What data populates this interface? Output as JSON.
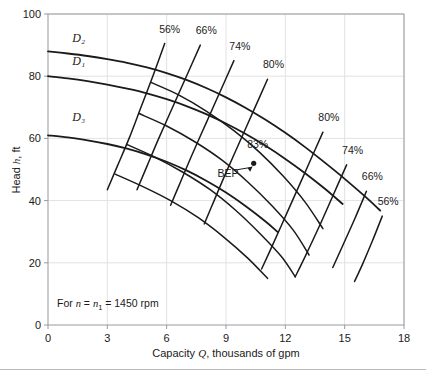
{
  "figure": {
    "note": "For n = n₁ = 1450 rpm",
    "note_prefix": "For ",
    "note_n1": "n",
    "note_eq1": " = ",
    "note_n2": "n",
    "note_sub": "1",
    "note_eq2": " = 1450 rpm",
    "bep_label": "BEP",
    "bep_value": "83%"
  },
  "axes": {
    "x": {
      "title": "Capacity Q, thousands of gpm",
      "title_prefix": "Capacity ",
      "title_symbol": "Q",
      "title_suffix": ", thousands of gpm",
      "ticks": [
        "0",
        "3",
        "6",
        "9",
        "12",
        "15",
        "18"
      ],
      "tick_values": [
        0,
        3,
        6,
        9,
        12,
        15,
        18
      ],
      "min": 0,
      "max": 18
    },
    "y": {
      "title": "Head h, ft",
      "title_prefix": "Head ",
      "title_symbol": "h",
      "title_suffix": ", ft",
      "ticks": [
        "0",
        "20",
        "40",
        "60",
        "80",
        "100"
      ],
      "tick_values": [
        0,
        20,
        40,
        60,
        80,
        100
      ],
      "min": 0,
      "max": 100
    }
  },
  "chart_data": {
    "type": "line",
    "title": "",
    "subtitle": "",
    "xlabel": "Capacity Q, thousands of gpm",
    "ylabel": "Head h, ft",
    "xlim": [
      0,
      18
    ],
    "ylim": [
      0,
      100
    ],
    "grid": true,
    "legend_position": "none",
    "annotations": [
      {
        "text": "For n = n₁ = 1450 rpm",
        "x": 1.3,
        "y": 10
      },
      {
        "text": "BEP",
        "x": 9.1,
        "y": 47.5
      },
      {
        "text": "83%",
        "x": 10.6,
        "y": 57
      }
    ],
    "bep_point": {
      "x": 10.4,
      "y": 52,
      "efficiency": 83
    },
    "series": [
      {
        "name": "D2",
        "label": "D₂",
        "label_x": 1.55,
        "label_y": 91,
        "points": [
          [
            0.0,
            88.0
          ],
          [
            1.0,
            87.3
          ],
          [
            2.0,
            86.5
          ],
          [
            3.0,
            85.5
          ],
          [
            4.0,
            84.3
          ],
          [
            5.0,
            82.8
          ],
          [
            6.0,
            81.0
          ],
          [
            7.0,
            78.8
          ],
          [
            8.0,
            76.2
          ],
          [
            9.0,
            73.2
          ],
          [
            10.0,
            69.8
          ],
          [
            11.0,
            66.0
          ],
          [
            12.0,
            61.8
          ],
          [
            13.0,
            57.2
          ],
          [
            14.0,
            52.2
          ],
          [
            15.0,
            47.0
          ],
          [
            16.0,
            41.5
          ],
          [
            16.8,
            36.8
          ]
        ]
      },
      {
        "name": "D1",
        "label": "D₁",
        "label_x": 1.55,
        "label_y": 83.5,
        "points": [
          [
            0.0,
            80.0
          ],
          [
            1.0,
            79.3
          ],
          [
            2.0,
            78.4
          ],
          [
            3.0,
            77.3
          ],
          [
            4.0,
            76.0
          ],
          [
            5.0,
            74.5
          ],
          [
            6.0,
            72.6
          ],
          [
            7.0,
            70.4
          ],
          [
            8.0,
            67.8
          ],
          [
            9.0,
            64.8
          ],
          [
            10.0,
            61.4
          ],
          [
            11.0,
            57.6
          ],
          [
            12.0,
            53.4
          ],
          [
            13.0,
            48.8
          ],
          [
            14.0,
            43.8
          ],
          [
            14.9,
            38.9
          ]
        ]
      },
      {
        "name": "D3",
        "label": "D₃",
        "label_x": 1.55,
        "label_y": 65.5,
        "points": [
          [
            0.0,
            61.0
          ],
          [
            1.0,
            60.3
          ],
          [
            2.0,
            59.4
          ],
          [
            3.0,
            58.2
          ],
          [
            4.0,
            56.7
          ],
          [
            5.0,
            54.8
          ],
          [
            6.0,
            52.5
          ],
          [
            7.0,
            49.7
          ],
          [
            8.0,
            46.4
          ],
          [
            9.0,
            42.6
          ],
          [
            10.0,
            38.2
          ],
          [
            11.0,
            33.3
          ],
          [
            11.6,
            30.0
          ]
        ]
      }
    ],
    "efficiency_curves": [
      {
        "label": "56%",
        "value": 56,
        "side": "left",
        "label_x": 6.15,
        "label_y": 94,
        "points": [
          [
            5.9,
            90.5
          ],
          [
            5.3,
            80.0
          ],
          [
            4.7,
            70.0
          ],
          [
            4.1,
            60.0
          ],
          [
            3.5,
            51.0
          ],
          [
            3.0,
            43.5
          ]
        ]
      },
      {
        "label": "66%",
        "value": 66,
        "side": "left",
        "label_x": 8.0,
        "label_y": 93.5,
        "points": [
          [
            7.7,
            90.0
          ],
          [
            7.0,
            80.0
          ],
          [
            6.3,
            70.0
          ],
          [
            5.6,
            60.0
          ],
          [
            5.0,
            51.0
          ],
          [
            4.5,
            43.5
          ]
        ]
      },
      {
        "label": "74%",
        "value": 74,
        "side": "left",
        "label_x": 9.7,
        "label_y": 88.5,
        "points": [
          [
            9.4,
            85.0
          ],
          [
            8.7,
            75.0
          ],
          [
            8.0,
            65.0
          ],
          [
            7.3,
            55.0
          ],
          [
            6.7,
            46.0
          ],
          [
            6.2,
            38.5
          ]
        ]
      },
      {
        "label": "80%",
        "value": 80,
        "side": "left",
        "label_x": 11.4,
        "label_y": 82.5,
        "points": [
          [
            11.1,
            79.0
          ],
          [
            10.4,
            69.0
          ],
          [
            9.7,
            59.0
          ],
          [
            9.0,
            49.0
          ],
          [
            8.4,
            40.0
          ],
          [
            7.9,
            32.5
          ]
        ]
      },
      {
        "label": "80%",
        "value": 80,
        "side": "right",
        "label_x": 14.2,
        "label_y": 65.5,
        "points": [
          [
            13.9,
            62.0
          ],
          [
            13.2,
            52.0
          ],
          [
            12.5,
            42.0
          ],
          [
            11.8,
            32.0
          ],
          [
            11.2,
            23.5
          ],
          [
            10.8,
            18.0
          ]
        ]
      },
      {
        "label": "74%",
        "value": 74,
        "side": "right",
        "label_x": 15.4,
        "label_y": 55.0,
        "points": [
          [
            15.1,
            51.5
          ],
          [
            14.4,
            41.5
          ],
          [
            13.7,
            31.5
          ],
          [
            13.0,
            22.0
          ],
          [
            12.5,
            15.5
          ]
        ]
      },
      {
        "label": "66%",
        "value": 66,
        "side": "right",
        "label_x": 16.4,
        "label_y": 46.5,
        "points": [
          [
            16.1,
            43.0
          ],
          [
            15.5,
            34.0
          ],
          [
            14.9,
            25.5
          ],
          [
            14.4,
            18.5
          ]
        ]
      },
      {
        "label": "56%",
        "value": 56,
        "side": "right",
        "label_x": 17.2,
        "label_y": 38.5,
        "points": [
          [
            16.9,
            35.0
          ],
          [
            16.4,
            27.0
          ],
          [
            15.9,
            19.5
          ],
          [
            15.5,
            14.0
          ]
        ]
      }
    ],
    "efficiency_arcs": [
      {
        "name": "arc-outer-upper",
        "points": [
          [
            5.2,
            78.0
          ],
          [
            6.6,
            74.0
          ],
          [
            8.0,
            68.8
          ],
          [
            9.4,
            62.5
          ],
          [
            10.7,
            55.5
          ],
          [
            11.9,
            47.8
          ],
          [
            13.0,
            39.5
          ],
          [
            13.9,
            31.0
          ]
        ]
      },
      {
        "name": "arc-mid-upper",
        "points": [
          [
            4.6,
            68.0
          ],
          [
            6.0,
            64.0
          ],
          [
            7.4,
            59.0
          ],
          [
            8.8,
            53.0
          ],
          [
            10.1,
            46.0
          ],
          [
            11.3,
            38.5
          ],
          [
            12.4,
            30.5
          ],
          [
            13.2,
            22.5
          ]
        ]
      },
      {
        "name": "arc-mid-lower",
        "points": [
          [
            4.0,
            58.0
          ],
          [
            5.4,
            54.0
          ],
          [
            6.8,
            49.2
          ],
          [
            8.2,
            43.5
          ],
          [
            9.5,
            36.8
          ],
          [
            10.7,
            29.5
          ],
          [
            11.8,
            22.0
          ],
          [
            12.5,
            15.5
          ]
        ]
      },
      {
        "name": "arc-lower",
        "points": [
          [
            3.4,
            48.5
          ],
          [
            4.8,
            44.5
          ],
          [
            6.2,
            40.0
          ],
          [
            7.6,
            34.5
          ],
          [
            8.9,
            28.2
          ],
          [
            10.1,
            21.5
          ],
          [
            11.1,
            15.0
          ]
        ]
      }
    ]
  },
  "colors": {
    "curve": "#1a1a1a",
    "grid": "#e2e2e6",
    "axis": "#9a9aa0",
    "text": "#1a1a1a",
    "background": "#ffffff",
    "footer_rule": "#b8b8bd"
  }
}
